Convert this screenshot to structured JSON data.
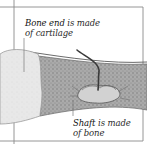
{
  "diagram": {
    "labels": {
      "bone_end": {
        "term": "Bone end",
        "rest_line1": " is made",
        "line2": "of cartilage"
      },
      "shaft": {
        "term": "Shaft",
        "rest_line1": " is made",
        "line2": "of bone"
      }
    },
    "parts": [
      "cartilage-end",
      "bone-shaft",
      "blood-vessel",
      "marrow-cavity"
    ],
    "colors": {
      "frame": "#8a8a8a",
      "cartilage": "#e6e6e6",
      "cartilage_edge": "#9a9a9a",
      "shaft": "#a8a8a8",
      "shaft_texture": "#7d7d7d",
      "vessel": "#3a3a3a",
      "cavity": "#cfcfcf",
      "text": "#2a2a2a"
    }
  }
}
